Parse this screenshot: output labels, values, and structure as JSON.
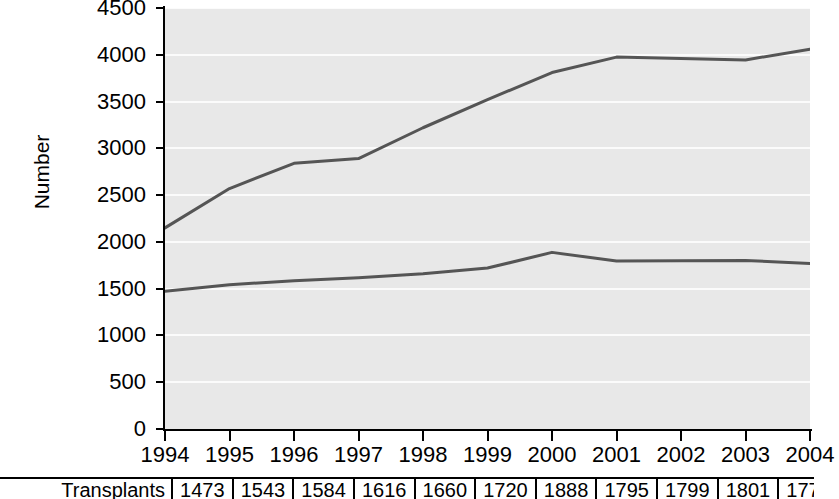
{
  "chart_data": {
    "type": "line",
    "title": "",
    "xlabel": "",
    "ylabel": "Number",
    "x": [
      1994,
      1995,
      1996,
      1997,
      1998,
      1999,
      2000,
      2001,
      2002,
      2003,
      2004
    ],
    "xtick_labels": [
      "1994",
      "1995",
      "1996",
      "1997",
      "1998",
      "1999",
      "2000",
      "2001",
      "2002",
      "2003",
      "2004"
    ],
    "ytick_labels": [
      "0",
      "500",
      "1000",
      "1500",
      "2000",
      "2500",
      "3000",
      "3500",
      "4000",
      "4500"
    ],
    "ytick_values": [
      0,
      500,
      1000,
      1500,
      2000,
      2500,
      3000,
      3500,
      4000,
      4500
    ],
    "ylim": [
      0,
      4500
    ],
    "xlim": [
      1994,
      2004
    ],
    "grid": true,
    "grid_axis": "y",
    "legend": "none",
    "plot_background": "#e8e8e8",
    "gridline_color": "#fbfbfb",
    "line_color": "#555555",
    "series": [
      {
        "name": "upper-series",
        "values": [
          2150,
          2570,
          2840,
          2890,
          3220,
          3520,
          3810,
          3975,
          3960,
          3945,
          4060
        ],
        "color": "#555555"
      },
      {
        "name": "lower-series",
        "values": [
          1473,
          1543,
          1584,
          1616,
          1660,
          1720,
          1888,
          1795,
          1799,
          1801,
          1770
        ],
        "color": "#555555"
      }
    ]
  },
  "table": {
    "row_label": "Transplants",
    "values": [
      "1473",
      "1543",
      "1584",
      "1616",
      "1660",
      "1720",
      "1888",
      "1795",
      "1799",
      "1801",
      "1770"
    ]
  }
}
